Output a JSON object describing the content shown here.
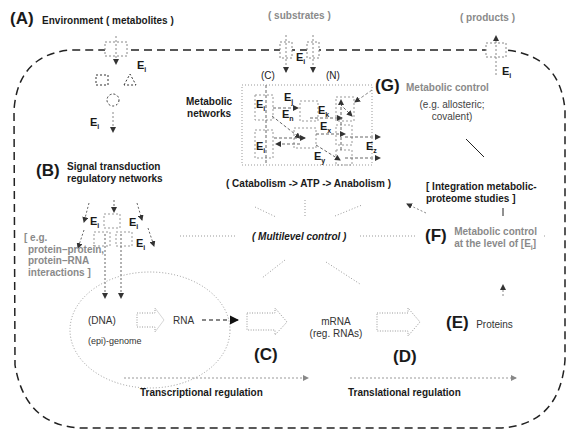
{
  "panel_A": {
    "letter": "(A)",
    "title": "Environment ( metabolites )"
  },
  "substrates_label": "( substrates )",
  "products_label": "( products )",
  "enzyme": {
    "base": "E",
    "sub_i": "i",
    "sub_j": "j",
    "sub_k": "k",
    "sub_n": "n",
    "sub_x": "x",
    "sub_y": "y",
    "sub_z": "z"
  },
  "metabolic_network": {
    "label_line1": "Metabolic",
    "label_line2": "networks",
    "carbon": "(C)",
    "nitrogen": "(N)",
    "caption": "( Catabolism -> ATP -> Anabolism )"
  },
  "panel_G": {
    "letter": "(G)",
    "title": "Metabolic control",
    "sub1": "(e.g. allosteric;",
    "sub2": "covalent)"
  },
  "panel_B": {
    "letter": "(B)",
    "title1": "Signal transduction",
    "title2": "regulatory networks",
    "eg1": "[ e.g.",
    "eg2": "protein–protein,",
    "eg3": "protein–RNA",
    "eg4": "interactions ]"
  },
  "center": {
    "label": "( Multilevel control )"
  },
  "integration": {
    "line1": "[ Integration metabolic-",
    "line2": "proteome studies ]"
  },
  "panel_F": {
    "letter": "(F)",
    "line1": "Metabolic control",
    "line2_prefix": "at the level of [E",
    "line2_sub": "i",
    "line2_suffix": "]"
  },
  "genome": {
    "dna": "(DNA)",
    "epi": "(epi)-genome",
    "rna": "RNA"
  },
  "panel_C": {
    "letter": "(C)"
  },
  "mrna": {
    "line1": "mRNA",
    "line2": "(reg. RNAs)"
  },
  "panel_D": {
    "letter": "(D)"
  },
  "panel_E": {
    "letter": "(E)",
    "title": "Proteins"
  },
  "regulation": {
    "transcriptional": "Transcriptional regulation",
    "translational": "Translational regulation"
  },
  "colors": {
    "ink": "#1a1a1a",
    "grey_text": "#8a8a8a",
    "dotted": "#9a9a9a"
  }
}
